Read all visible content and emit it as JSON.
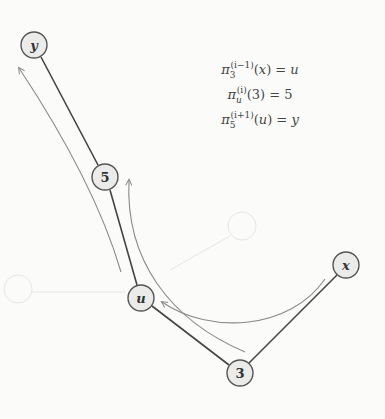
{
  "nodes": [
    {
      "id": "y",
      "label": "y",
      "italic": true,
      "cx": 34,
      "cy": 45
    },
    {
      "id": "5",
      "label": "5",
      "italic": false,
      "cx": 105,
      "cy": 177
    },
    {
      "id": "u",
      "label": "u",
      "italic": true,
      "cx": 141,
      "cy": 298
    },
    {
      "id": "3",
      "label": "3",
      "italic": false,
      "cx": 240,
      "cy": 373
    },
    {
      "id": "x",
      "label": "x",
      "italic": true,
      "cx": 346,
      "cy": 265
    }
  ],
  "edges": [
    {
      "from": "y",
      "to": "5"
    },
    {
      "from": "5",
      "to": "u"
    },
    {
      "from": "u",
      "to": "3"
    },
    {
      "from": "3",
      "to": "x"
    }
  ],
  "arrows": [
    {
      "name": "arrow-x-to-u",
      "from": "x",
      "to": "u"
    },
    {
      "name": "arrow-3-to-5",
      "from": "3",
      "to": "5"
    },
    {
      "name": "arrow-u-to-y",
      "from": "u",
      "to": "y"
    }
  ],
  "equations": [
    {
      "pi": "π",
      "sub": "3",
      "sup": "(i−1)",
      "arg": "x",
      "arg_italic": true,
      "rhs": "u",
      "rhs_italic": true
    },
    {
      "pi": "π",
      "sub": "u",
      "sup": "(i)",
      "arg": "3",
      "arg_italic": false,
      "rhs": "5",
      "rhs_italic": false
    },
    {
      "pi": "π",
      "sub": "5",
      "sup": "(i+1)",
      "arg": "u",
      "arg_italic": true,
      "rhs": "y",
      "rhs_italic": true
    }
  ]
}
